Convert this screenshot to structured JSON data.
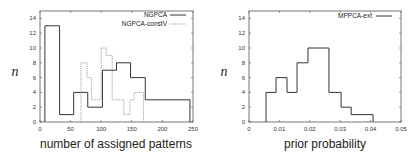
{
  "chart_data": [
    {
      "type": "histogram-step",
      "title": "",
      "xlabel": "number of assigned patterns",
      "ylabel": "n",
      "xlim": [
        0,
        250
      ],
      "ylim": [
        0,
        15
      ],
      "xticks": [
        0,
        50,
        100,
        150,
        200,
        250
      ],
      "xtick_labels": [
        "0",
        "50",
        "100",
        "150",
        "200",
        "250"
      ],
      "yticks": [
        0,
        2,
        4,
        6,
        8,
        10,
        12,
        14
      ],
      "ytick_labels": [
        "0",
        "2",
        "4",
        "6",
        "8",
        "10",
        "12",
        "14"
      ],
      "grid": false,
      "legend_position": "top-right",
      "series": [
        {
          "name": "NGPCA",
          "style": "solid",
          "bin_edges": [
            8,
            32,
            55,
            78,
            102,
            125,
            148,
            172,
            245
          ],
          "values": [
            13,
            1,
            4,
            2,
            7,
            8,
            6,
            3
          ]
        },
        {
          "name": "NGPCA-constV",
          "style": "dashed",
          "bin_edges": [
            67,
            77,
            84,
            100,
            108,
            118,
            137,
            147,
            154,
            169
          ],
          "values": [
            8,
            6,
            3,
            10,
            9,
            3,
            1,
            3,
            4
          ]
        }
      ]
    },
    {
      "type": "histogram-step",
      "title": "",
      "xlabel": "prior probability",
      "ylabel": "n",
      "xlim": [
        0,
        0.05
      ],
      "ylim": [
        0,
        15
      ],
      "xticks": [
        0,
        0.01,
        0.02,
        0.03,
        0.04,
        0.05
      ],
      "xtick_labels": [
        "0",
        "0.01",
        "0.02",
        "0.03",
        "0.04",
        "0.05"
      ],
      "yticks": [
        0,
        2,
        4,
        6,
        8,
        10,
        12,
        14
      ],
      "ytick_labels": [
        "0",
        "2",
        "4",
        "6",
        "8",
        "10",
        "12",
        "14"
      ],
      "grid": false,
      "legend_position": "top-right",
      "series": [
        {
          "name": "MPPCA-ext",
          "style": "solid",
          "bin_edges": [
            0.0056,
            0.0089,
            0.0125,
            0.0158,
            0.0194,
            0.0263,
            0.0303,
            0.0336,
            0.0408
          ],
          "values": [
            4,
            6,
            4,
            8,
            10,
            4,
            2,
            1
          ]
        }
      ]
    }
  ],
  "layout": [
    {
      "frame": {
        "x0": 40,
        "x1": 193,
        "y0": 11,
        "y1": 122
      },
      "ylabel_pos": [
        15,
        76
      ],
      "xlabel_pos": [
        116,
        148
      ],
      "legend": {
        "x_text_end": 167,
        "x_line0": 170,
        "x_line1": 186,
        "y0": 15,
        "dy": 9
      }
    },
    {
      "frame": {
        "x0": 249,
        "x1": 401,
        "y0": 11,
        "y1": 122
      },
      "ylabel_pos": [
        224,
        76
      ],
      "xlabel_pos": [
        325,
        148
      ],
      "legend": {
        "x_text_end": 372,
        "x_line0": 376,
        "x_line1": 392,
        "y0": 16,
        "dy": 9
      }
    }
  ],
  "colors": {
    "solid": "#333333",
    "dashed": "#888888",
    "frame": "#555555"
  }
}
